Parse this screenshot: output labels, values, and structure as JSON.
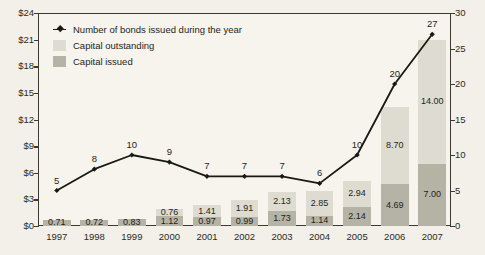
{
  "chart_data": {
    "type": "bar",
    "title": "",
    "subtitle": "",
    "xlabel": "",
    "ylabel": "",
    "y2label": "",
    "grid": false,
    "legend_position": "top-left",
    "categories": [
      "1997",
      "1998",
      "1999",
      "2000",
      "2001",
      "2002",
      "2003",
      "2004",
      "2005",
      "2006",
      "2007"
    ],
    "ylim": [
      0,
      24
    ],
    "yticks": [
      "$0",
      "$3",
      "$6",
      "$9",
      "$12",
      "$15",
      "$18",
      "$21",
      "$24"
    ],
    "ytick_values": [
      0,
      3,
      6,
      9,
      12,
      15,
      18,
      21,
      24
    ],
    "y2lim": [
      0,
      30
    ],
    "y2ticks": [
      "0",
      "5",
      "10",
      "15",
      "20",
      "25",
      "30"
    ],
    "y2tick_values": [
      0,
      5,
      10,
      15,
      20,
      25,
      30
    ],
    "series": [
      {
        "name": "Capital issued",
        "type": "bar",
        "stack": "capital",
        "axis": "left",
        "color": "#b5b3a5",
        "values": [
          0.71,
          0.72,
          0.83,
          1.12,
          0.97,
          0.99,
          1.73,
          1.14,
          2.14,
          4.69,
          7.0
        ],
        "labels": [
          "0.71",
          "0.72",
          "0.83",
          "1.12",
          "0.97",
          "0.99",
          "1.73",
          "1.14",
          "2.14",
          "4.69",
          "7.00"
        ]
      },
      {
        "name": "Capital outstanding",
        "type": "bar",
        "stack": "capital",
        "axis": "left",
        "color": "#dedcd0",
        "values": [
          0.0,
          0.0,
          0.0,
          0.76,
          1.41,
          1.91,
          2.13,
          2.85,
          2.94,
          8.7,
          14.0
        ],
        "labels": [
          "",
          "",
          "",
          "0.76",
          "1.41",
          "1.91",
          "2.13",
          "2.85",
          "2.94",
          "8.70",
          "14.00"
        ]
      },
      {
        "name": "Number of bonds issued during the year",
        "type": "line",
        "axis": "right",
        "color": "#1a1a14",
        "values": [
          5,
          8,
          10,
          9,
          7,
          7,
          7,
          6,
          10,
          20,
          27
        ],
        "labels": [
          "5",
          "8",
          "10",
          "9",
          "7",
          "7",
          "7",
          "6",
          "10",
          "20",
          "27"
        ]
      }
    ]
  },
  "legend": {
    "items": [
      {
        "label": "Number of bonds issued during the year",
        "marker": "line-marker"
      },
      {
        "label": "Capital outstanding",
        "marker": "swatch-light"
      },
      {
        "label": "Capital issued",
        "marker": "swatch-dark"
      }
    ]
  },
  "colors": {
    "background": "#f2f0e8",
    "plot_background": "#f6f4ec",
    "axis": "#3a3a33",
    "capital_outstanding": "#dedcd0",
    "capital_issued": "#b5b3a5",
    "line": "#1a1a14",
    "text": "#1f1f1a"
  }
}
